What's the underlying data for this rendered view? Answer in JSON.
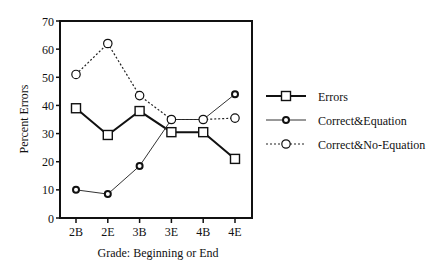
{
  "chart_data": {
    "type": "line",
    "title": "",
    "xlabel": "Grade: Beginning or End",
    "ylabel": "Percent Errors",
    "categories": [
      "2B",
      "2E",
      "3B",
      "3E",
      "4B",
      "4E"
    ],
    "ylim": [
      0,
      70
    ],
    "yticks": [
      0,
      10,
      20,
      30,
      40,
      50,
      60,
      70
    ],
    "grid": false,
    "legend_position": "right",
    "series": [
      {
        "name": "Errors",
        "marker": "square",
        "line": "solid-thick",
        "values": [
          39,
          29.5,
          38,
          30.5,
          30.5,
          21
        ]
      },
      {
        "name": "Correct&Equation",
        "marker": "diamond",
        "line": "solid-thin",
        "values": [
          10,
          8.5,
          18.5,
          35,
          35,
          44
        ]
      },
      {
        "name": "Correct&No-Equation",
        "marker": "circle",
        "line": "dotted",
        "values": [
          51,
          62,
          43.5,
          35,
          35,
          35.5
        ]
      }
    ]
  },
  "legend": {
    "items": [
      "Errors",
      "Correct&Equation",
      "Correct&No-Equation"
    ]
  }
}
